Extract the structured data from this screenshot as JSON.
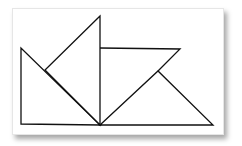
{
  "diagram": {
    "type": "tangram-style geometric line figure",
    "stroke_color": "#111111",
    "background": "#ffffff",
    "shapes": [
      {
        "name": "left-right-triangle",
        "points": "21,48 21,124 100,125"
      },
      {
        "name": "tall-triangle",
        "points": "100,16 45,70 100,125"
      },
      {
        "name": "parallelogram-upper-edge",
        "points": "100,48 180,49 158,71"
      },
      {
        "name": "right-triangle",
        "points": "100,125 158,71 213,125"
      }
    ]
  }
}
